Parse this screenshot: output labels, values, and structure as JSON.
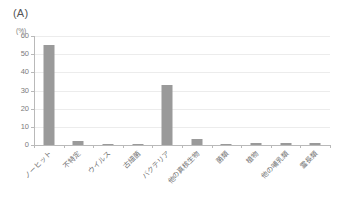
{
  "panel": {
    "label": "(A)"
  },
  "chart_data": {
    "type": "bar",
    "title": "(A)",
    "subtitle": "",
    "xlabel": "",
    "ylabel": "(%)",
    "yunit": "(%)",
    "ylim": [
      0,
      60
    ],
    "ytick_labels": [
      "60",
      "50",
      "40",
      "30",
      "20",
      "10",
      "0"
    ],
    "ytick_values": [
      60,
      50,
      40,
      30,
      20,
      10,
      0
    ],
    "grid": true,
    "grid_axis": "y",
    "legend": false,
    "legend_position": "none",
    "bar_color": "#9a9a9a",
    "axis_color": "#b9b9b9",
    "grid_color": "#ececec",
    "categories": [
      "ノーヒット",
      "不特定",
      "ウイルス",
      "古細菌",
      "バクテリア",
      "他の真核生物",
      "菌類",
      "植物",
      "他の哺乳類",
      "霊長類"
    ],
    "values": [
      55.3,
      2.0,
      0.5,
      0.7,
      33.2,
      3.5,
      0.8,
      1.2,
      1.3,
      0.9
    ]
  }
}
